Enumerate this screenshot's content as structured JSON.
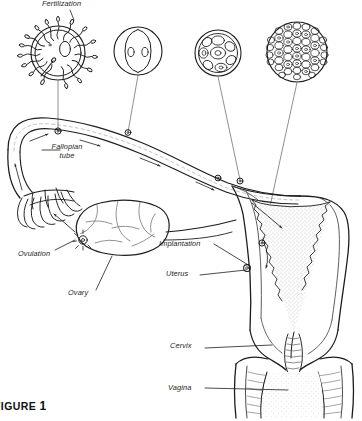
{
  "figure": {
    "caption_prefix": "FIGURE",
    "caption_number": "1",
    "caption_full": "FIGURE 1"
  },
  "diagram": {
    "type": "anatomical-illustration",
    "style": "black-and-white line drawing, stippled shading",
    "background_color": "#ffffff",
    "line_color": "#1d1d1d",
    "shading_color": "#8c8c8c"
  },
  "labels": [
    {
      "id": "fertilization",
      "text": "Fertilization",
      "x": 42,
      "y": 1,
      "italic": true
    },
    {
      "id": "fallopian-tube",
      "text": "Fallopian tube",
      "line1": "Fallopian",
      "line2": "tube",
      "x": 44,
      "y": 143,
      "italic": true
    },
    {
      "id": "ovulation",
      "text": "Ovulation",
      "x": 20,
      "y": 253,
      "italic": true
    },
    {
      "id": "ovary",
      "text": "Ovary",
      "x": 69,
      "y": 292,
      "italic": true
    },
    {
      "id": "implantation",
      "text": "Implantation",
      "x": 160,
      "y": 240,
      "italic": true
    },
    {
      "id": "uterus",
      "text": "Uterus",
      "x": 166,
      "y": 271,
      "italic": true
    },
    {
      "id": "cervix",
      "text": "Cervix",
      "x": 170,
      "y": 345,
      "italic": true
    },
    {
      "id": "vagina",
      "text": "Vagina",
      "x": 168,
      "y": 385,
      "italic": true
    }
  ],
  "stages": [
    {
      "id": "stage-zygote",
      "name": "fertilized-ovum",
      "description": "ovum surrounded by sperm, one sperm penetrating",
      "cx": 58,
      "cy": 53,
      "r": 27,
      "cells": 1,
      "sperm_count": 18
    },
    {
      "id": "stage-two-cell",
      "name": "two-cell-stage",
      "description": "two blastomeres within zona pellucida",
      "cx": 138,
      "cy": 51,
      "r": 24,
      "cells": 2
    },
    {
      "id": "stage-morula",
      "name": "morula",
      "description": "eight-cell morula within zona pellucida",
      "cx": 218,
      "cy": 53,
      "r": 23,
      "cells": 8
    },
    {
      "id": "stage-blastocyst",
      "name": "blastocyst",
      "description": "blastocyst with many small cells",
      "cx": 297,
      "cy": 52,
      "r": 30,
      "cells": 60
    }
  ],
  "structures": [
    {
      "id": "fallopian-tube",
      "name": "fallopian-tube"
    },
    {
      "id": "fimbriae",
      "name": "fimbriae"
    },
    {
      "id": "ovary",
      "name": "ovary"
    },
    {
      "id": "uterus",
      "name": "uterus"
    },
    {
      "id": "endometrium",
      "name": "endometrium"
    },
    {
      "id": "cervix",
      "name": "cervix"
    },
    {
      "id": "vagina",
      "name": "vagina"
    }
  ]
}
